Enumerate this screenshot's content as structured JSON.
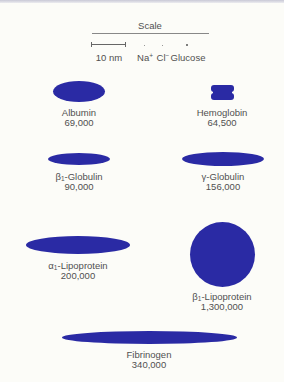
{
  "scale": {
    "title": "Scale",
    "bar_label": "10 nm",
    "items": [
      {
        "symbol": "Na",
        "charge": "+"
      },
      {
        "symbol": "Cl",
        "charge": "−"
      },
      {
        "symbol": "Glucose",
        "charge": ""
      }
    ]
  },
  "shape_color": "#2a2aa4",
  "proteins": [
    {
      "id": "albumin",
      "prefix": "",
      "subscript": "",
      "name": "Albumin",
      "mw": "69,000"
    },
    {
      "id": "hemoglobin",
      "prefix": "",
      "subscript": "",
      "name": "Hemoglobin",
      "mw": "64,500"
    },
    {
      "id": "beta1-globulin",
      "prefix": "β",
      "subscript": "1",
      "name": "-Globulin",
      "mw": "90,000"
    },
    {
      "id": "gamma-globulin",
      "prefix": "γ",
      "subscript": "",
      "name": "-Globulin",
      "mw": "156,000"
    },
    {
      "id": "alpha1-lipoprotein",
      "prefix": "α",
      "subscript": "1",
      "name": "-Lipoprotein",
      "mw": "200,000"
    },
    {
      "id": "beta1-lipoprotein",
      "prefix": "β",
      "subscript": "1",
      "name": "-Lipoprotein",
      "mw": "1,300,000"
    },
    {
      "id": "fibrinogen",
      "prefix": "",
      "subscript": "",
      "name": "Fibrinogen",
      "mw": "340,000"
    }
  ]
}
